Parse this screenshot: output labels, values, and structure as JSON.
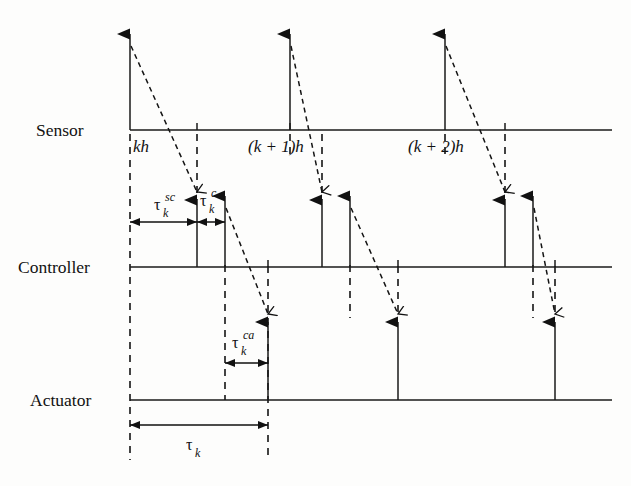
{
  "figure": {
    "background_color": "#fdfdfc",
    "ink_color": "#111111"
  },
  "lanes": [
    {
      "id": "sensor",
      "label": "Sensor",
      "axis_y": 130,
      "label_x": 36,
      "label_y": 136
    },
    {
      "id": "controller",
      "label": "Controller",
      "axis_y": 267,
      "label_x": 18,
      "label_y": 273
    },
    {
      "id": "actuator",
      "label": "Actuator",
      "axis_y": 400,
      "label_x": 30,
      "label_y": 406
    }
  ],
  "axis": {
    "x_start": 130,
    "x_end": 612
  },
  "tick_labels": [
    {
      "id": "kh",
      "text": "kh",
      "x": 133,
      "y": 152
    },
    {
      "id": "k-plus-1-h",
      "text": "(k + 1)h",
      "x": 248,
      "y": 152
    },
    {
      "id": "k-plus-2-h",
      "text": "(k + 2)h",
      "x": 408,
      "y": 152
    }
  ],
  "sensor_events": [
    {
      "x": 130,
      "top_y": 34
    },
    {
      "x": 290,
      "top_y": 34
    },
    {
      "x": 445,
      "top_y": 34
    }
  ],
  "controller_events": [
    {
      "x": 197,
      "top_y": 200
    },
    {
      "x": 225,
      "top_y": 196
    },
    {
      "x": 322,
      "top_y": 200
    },
    {
      "x": 350,
      "top_y": 196
    },
    {
      "x": 505,
      "top_y": 200
    },
    {
      "x": 533,
      "top_y": 196
    }
  ],
  "actuator_events": [
    {
      "x": 268,
      "top_y": 322
    },
    {
      "x": 398,
      "top_y": 322
    },
    {
      "x": 555,
      "top_y": 322
    }
  ],
  "network_delays": [
    {
      "id": "sensor-to-controller-1",
      "x1": 131,
      "y1": 46,
      "x2": 197,
      "y2": 192
    },
    {
      "id": "sensor-to-controller-2",
      "x1": 291,
      "y1": 46,
      "x2": 322,
      "y2": 192
    },
    {
      "id": "sensor-to-controller-3",
      "x1": 446,
      "y1": 46,
      "x2": 505,
      "y2": 192
    },
    {
      "id": "controller-to-actuator-1",
      "x1": 226,
      "y1": 208,
      "x2": 268,
      "y2": 314
    },
    {
      "id": "controller-to-actuator-2",
      "x1": 351,
      "y1": 208,
      "x2": 398,
      "y2": 314
    },
    {
      "id": "controller-to-actuator-3",
      "x1": 534,
      "y1": 208,
      "x2": 555,
      "y2": 314
    }
  ],
  "guide_lines": [
    {
      "id": "guide-kh",
      "x": 130,
      "y1": 134,
      "y2": 460
    },
    {
      "id": "guide-sc-arrival",
      "x": 197,
      "y1": 134,
      "y2": 200
    },
    {
      "id": "guide-c-done",
      "x": 225,
      "y1": 265,
      "y2": 400
    },
    {
      "id": "guide-actuate-1",
      "x": 268,
      "y1": 266,
      "y2": 460
    },
    {
      "id": "guide-sensor-2",
      "x": 290,
      "y1": 134,
      "y2": 160
    },
    {
      "id": "guide-sc-arrival-2",
      "x": 322,
      "y1": 134,
      "y2": 200
    },
    {
      "id": "guide-c-done-2",
      "x": 350,
      "y1": 265,
      "y2": 318
    },
    {
      "id": "guide-actuate-2",
      "x": 398,
      "y1": 266,
      "y2": 318
    },
    {
      "id": "guide-sensor-3",
      "x": 445,
      "y1": 134,
      "y2": 160
    },
    {
      "id": "guide-sc-arrival-3",
      "x": 505,
      "y1": 134,
      "y2": 200
    },
    {
      "id": "guide-c-done-3",
      "x": 533,
      "y1": 265,
      "y2": 318
    },
    {
      "id": "guide-actuate-3",
      "x": 555,
      "y1": 266,
      "y2": 318
    }
  ],
  "dimensions": [
    {
      "id": "tau-sc",
      "base": "τ",
      "subscript": "k",
      "superscript": "sc",
      "x1": 130,
      "x2": 197,
      "y": 222,
      "label_x": 154,
      "label_y": 210
    },
    {
      "id": "tau-c",
      "base": "τ",
      "subscript": "k",
      "superscript": "c",
      "x1": 197,
      "x2": 225,
      "y": 222,
      "label_x": 200,
      "label_y": 206
    },
    {
      "id": "tau-ca",
      "base": "τ",
      "subscript": "k",
      "superscript": "ca",
      "x1": 225,
      "x2": 268,
      "y": 363,
      "label_x": 232,
      "label_y": 348
    },
    {
      "id": "tau-total",
      "base": "τ",
      "subscript": "k",
      "superscript": "",
      "x1": 130,
      "x2": 268,
      "y": 425,
      "label_x": 186,
      "label_y": 450
    }
  ],
  "axis_ticks": [
    {
      "id": "tick-sensor-kh",
      "lane": "sensor",
      "x": 197
    },
    {
      "id": "tick-sensor-k1h",
      "lane": "sensor",
      "x": 290
    },
    {
      "id": "tick-sensor-k2h",
      "lane": "sensor",
      "x": 505
    },
    {
      "id": "tick-controller-a",
      "lane": "controller",
      "x": 268
    },
    {
      "id": "tick-controller-b",
      "lane": "controller",
      "x": 398
    },
    {
      "id": "tick-controller-c",
      "lane": "controller",
      "x": 555
    }
  ]
}
